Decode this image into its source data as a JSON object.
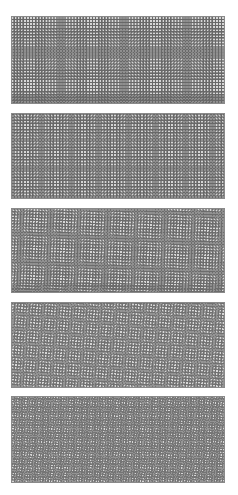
{
  "figure": {
    "panels": [
      {
        "id": "moire-1",
        "top": 16,
        "height": 88,
        "grid_a": 3.0,
        "grid_b": 3.15,
        "angle_b": 0,
        "line_color": "#4a4a4a"
      },
      {
        "id": "moire-2",
        "top": 113,
        "height": 86,
        "grid_a": 3.0,
        "grid_b": 3.35,
        "angle_b": 0,
        "line_color": "#4a4a4a"
      },
      {
        "id": "moire-3",
        "top": 208,
        "height": 85,
        "grid_a": 3.0,
        "grid_b": 3.0,
        "angle_b": 6,
        "line_color": "#4f4f4f"
      },
      {
        "id": "moire-4",
        "top": 302,
        "height": 86,
        "grid_a": 3.0,
        "grid_b": 3.0,
        "angle_b": 12,
        "line_color": "#555555"
      },
      {
        "id": "moire-5",
        "top": 396,
        "height": 87,
        "grid_a": 2.6,
        "grid_b": 2.6,
        "angle_b": 20,
        "line_color": "#5a5a5a"
      }
    ]
  }
}
